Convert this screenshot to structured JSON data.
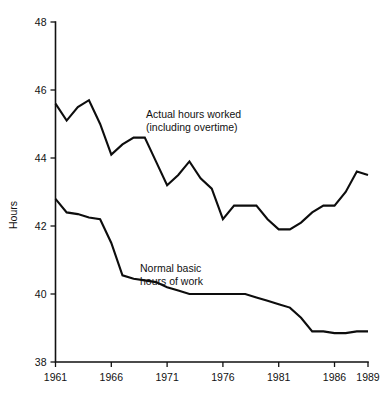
{
  "chart_data": {
    "type": "line",
    "title": "",
    "xlabel": "",
    "ylabel": "Hours",
    "xlim": [
      1961,
      1989
    ],
    "ylim": [
      38,
      48
    ],
    "grid": false,
    "legend_position": "inline-annotation",
    "x": [
      1961,
      1962,
      1963,
      1964,
      1965,
      1966,
      1967,
      1968,
      1969,
      1970,
      1971,
      1972,
      1973,
      1974,
      1975,
      1976,
      1977,
      1978,
      1979,
      1980,
      1981,
      1982,
      1983,
      1984,
      1985,
      1986,
      1987,
      1988,
      1989
    ],
    "x_tick_labels": [
      "1961",
      "1966",
      "1971",
      "1976",
      "1981",
      "1986",
      "1989"
    ],
    "x_tick_values": [
      1961,
      1966,
      1971,
      1976,
      1981,
      1986,
      1989
    ],
    "y_tick_labels": [
      "38",
      "40",
      "42",
      "44",
      "46",
      "48"
    ],
    "y_tick_values": [
      38,
      40,
      42,
      44,
      46,
      48
    ],
    "series": [
      {
        "name": "Actual hours worked (including overtime)",
        "annotation_lines": [
          "Actual hours worked",
          "(including overtime)"
        ],
        "values": [
          45.6,
          45.1,
          45.5,
          45.7,
          45.0,
          44.1,
          44.4,
          44.6,
          44.6,
          43.9,
          43.2,
          43.5,
          43.9,
          43.4,
          43.1,
          42.2,
          42.6,
          42.6,
          42.6,
          42.2,
          41.9,
          41.9,
          42.1,
          42.4,
          42.6,
          42.6,
          43.0,
          43.6,
          43.5
        ]
      },
      {
        "name": "Normal basic hours of work",
        "annotation_lines": [
          "Normal basic",
          "hours of work"
        ],
        "values": [
          42.8,
          42.4,
          42.35,
          42.25,
          42.2,
          41.5,
          40.55,
          40.45,
          40.4,
          40.35,
          40.2,
          40.1,
          40.0,
          40.0,
          40.0,
          40.0,
          40.0,
          40.0,
          39.9,
          39.8,
          39.7,
          39.6,
          39.3,
          38.9,
          38.9,
          38.85,
          38.85,
          38.9,
          38.9
        ]
      }
    ]
  },
  "annotations": {
    "actual_line1": "Actual hours worked",
    "actual_line2": "(including overtime)",
    "basic_line1": "Normal basic",
    "basic_line2": "hours of work"
  },
  "axis": {
    "y_label": "Hours"
  }
}
